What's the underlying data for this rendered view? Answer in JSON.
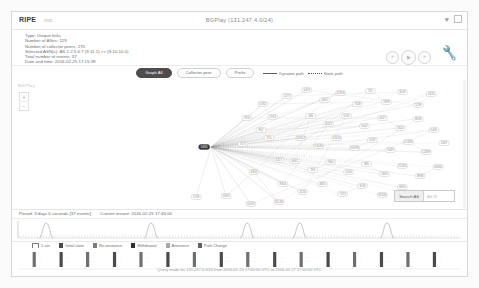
{
  "header": {
    "brand": "RIPE",
    "brand_sub": "stat",
    "title": "BGPlay (131.247.4.0/24)",
    "heart_icon": "heart-icon",
    "expand_icon": "fullscreen-icon"
  },
  "info": {
    "lines": [
      "Type: Unique links",
      "Number of ASes: 129",
      "Number of collector peers: 270",
      "Selected ASN(s): AS 1.2.5.6.7 (9.11.1) >> (9.10.10.0)",
      "Total number of events: 37",
      "Date and time: 2016-02-25 17:15:39"
    ]
  },
  "playback": {
    "rewind_label": "«",
    "play_label": "▶",
    "forward_label": "»",
    "settings_icon": "wrench-icon"
  },
  "tabs": [
    {
      "label": "Graph All",
      "active": true
    },
    {
      "label": "Collector peer",
      "active": false
    },
    {
      "label": "Prefix",
      "active": false
    }
  ],
  "path_legend": [
    {
      "label": "Dynamic path",
      "style": "solid"
    },
    {
      "label": "Static path",
      "style": "dotted"
    }
  ],
  "graph": {
    "watermark": "BGPlay",
    "zoom_in_label": "+",
    "zoom_out_label": "−",
    "search_button": "Search AS",
    "search_placeholder": "AS N",
    "source_node_label": "AS",
    "nodes": [
      {
        "id": "src",
        "x": 193,
        "y": 135,
        "label": "5455",
        "source": true
      },
      {
        "id": "n1",
        "x": 243,
        "y": 160,
        "label": "3356"
      },
      {
        "id": "n2",
        "x": 185,
        "y": 185,
        "label": "1299"
      },
      {
        "id": "n3",
        "x": 215,
        "y": 184,
        "label": "6939"
      },
      {
        "id": "n4",
        "x": 262,
        "y": 105,
        "label": "2914"
      },
      {
        "id": "n5",
        "x": 258,
        "y": 126,
        "label": "174"
      },
      {
        "id": "n6",
        "x": 268,
        "y": 148,
        "label": "3257"
      },
      {
        "id": "n7",
        "x": 252,
        "y": 92,
        "label": "6762"
      },
      {
        "id": "n8",
        "x": 276,
        "y": 84,
        "label": "1273"
      },
      {
        "id": "n9",
        "x": 296,
        "y": 78,
        "label": "6453"
      },
      {
        "id": "n10",
        "x": 314,
        "y": 88,
        "label": "3491"
      },
      {
        "id": "n11",
        "x": 330,
        "y": 81,
        "label": "12956"
      },
      {
        "id": "n12",
        "x": 347,
        "y": 92,
        "label": "7018"
      },
      {
        "id": "n13",
        "x": 360,
        "y": 79,
        "label": "701"
      },
      {
        "id": "n14",
        "x": 376,
        "y": 90,
        "label": "2828"
      },
      {
        "id": "n15",
        "x": 392,
        "y": 80,
        "label": "3549"
      },
      {
        "id": "n16",
        "x": 408,
        "y": 93,
        "label": "1239"
      },
      {
        "id": "n17",
        "x": 421,
        "y": 82,
        "label": "4323"
      },
      {
        "id": "n18",
        "x": 300,
        "y": 104,
        "label": "286"
      },
      {
        "id": "n19",
        "x": 318,
        "y": 112,
        "label": "8220"
      },
      {
        "id": "n20",
        "x": 336,
        "y": 104,
        "label": "5511"
      },
      {
        "id": "n21",
        "x": 354,
        "y": 114,
        "label": "9002"
      },
      {
        "id": "n22",
        "x": 372,
        "y": 106,
        "label": "4637"
      },
      {
        "id": "n23",
        "x": 390,
        "y": 116,
        "label": "3320"
      },
      {
        "id": "n24",
        "x": 408,
        "y": 107,
        "label": "8928"
      },
      {
        "id": "n25",
        "x": 424,
        "y": 118,
        "label": "6461"
      },
      {
        "id": "n26",
        "x": 290,
        "y": 126,
        "label": "20912"
      },
      {
        "id": "n27",
        "x": 308,
        "y": 134,
        "label": "13030"
      },
      {
        "id": "n28",
        "x": 326,
        "y": 126,
        "label": "31133"
      },
      {
        "id": "n29",
        "x": 344,
        "y": 136,
        "label": "29076"
      },
      {
        "id": "n30",
        "x": 362,
        "y": 128,
        "label": "3267"
      },
      {
        "id": "n31",
        "x": 380,
        "y": 138,
        "label": "9049"
      },
      {
        "id": "n32",
        "x": 398,
        "y": 130,
        "label": "15169"
      },
      {
        "id": "n33",
        "x": 416,
        "y": 140,
        "label": "12389"
      },
      {
        "id": "n34",
        "x": 434,
        "y": 131,
        "label": "2497"
      },
      {
        "id": "n35",
        "x": 284,
        "y": 149,
        "label": "6461"
      },
      {
        "id": "n36",
        "x": 302,
        "y": 158,
        "label": "293"
      },
      {
        "id": "n37",
        "x": 320,
        "y": 150,
        "label": "7660"
      },
      {
        "id": "n38",
        "x": 338,
        "y": 160,
        "label": "1103"
      },
      {
        "id": "n39",
        "x": 356,
        "y": 152,
        "label": "680"
      },
      {
        "id": "n40",
        "x": 374,
        "y": 162,
        "label": "2603"
      },
      {
        "id": "n41",
        "x": 392,
        "y": 154,
        "label": "21320"
      },
      {
        "id": "n42",
        "x": 410,
        "y": 164,
        "label": "8968"
      },
      {
        "id": "n43",
        "x": 428,
        "y": 155,
        "label": "24961"
      },
      {
        "id": "n44",
        "x": 272,
        "y": 172,
        "label": "9304"
      },
      {
        "id": "n45",
        "x": 292,
        "y": 180,
        "label": "4134"
      },
      {
        "id": "n46",
        "x": 312,
        "y": 172,
        "label": "4826"
      },
      {
        "id": "n47",
        "x": 332,
        "y": 182,
        "label": "7473"
      },
      {
        "id": "n48",
        "x": 352,
        "y": 174,
        "label": "3130"
      },
      {
        "id": "n49",
        "x": 372,
        "y": 183,
        "label": "35320"
      },
      {
        "id": "n50",
        "x": 392,
        "y": 175,
        "label": "6830"
      },
      {
        "id": "n51",
        "x": 412,
        "y": 184,
        "label": "8551"
      },
      {
        "id": "n52",
        "x": 250,
        "y": 118,
        "label": "852"
      },
      {
        "id": "n53",
        "x": 236,
        "y": 106,
        "label": "1916"
      },
      {
        "id": "n54",
        "x": 232,
        "y": 132,
        "label": "7575"
      },
      {
        "id": "n55",
        "x": 268,
        "y": 190,
        "label": "20130"
      },
      {
        "id": "n56",
        "x": 240,
        "y": 192,
        "label": "11537"
      }
    ]
  },
  "timeline": {
    "period_label": "Period: 3 days 0 seconds [37 events]",
    "instant_label": "Current instant: 2016-02-25 17:45:00",
    "histogram_peaks": [
      0.06,
      0.3,
      0.52,
      0.64,
      0.84
    ],
    "event_bar_positions": [
      0.025,
      0.088,
      0.15,
      0.213,
      0.275,
      0.338,
      0.4,
      0.463,
      0.525,
      0.588,
      0.65,
      0.713,
      0.775,
      0.838,
      0.9,
      0.962
    ]
  },
  "legend": [
    {
      "label": "1 sec",
      "type": "tick",
      "color": "#7a7a7a"
    },
    {
      "label": "Initial state",
      "type": "swatch",
      "color": "#4a4a4a"
    },
    {
      "label": "Re-announce",
      "type": "swatch",
      "color": "#7b7b7b"
    },
    {
      "label": "Withdrawal",
      "type": "swatch",
      "color": "#2f2f2f"
    },
    {
      "label": "Announce",
      "type": "swatch",
      "color": "#a8a8a8"
    },
    {
      "label": "Path Change",
      "type": "swatch",
      "color": "#616161"
    }
  ],
  "footer": {
    "query_text": "Query made for 131.247.4.0/24 from 2016-02-25 17:00:00 UTC to 2016-02-27 17:00:00 UTC"
  }
}
